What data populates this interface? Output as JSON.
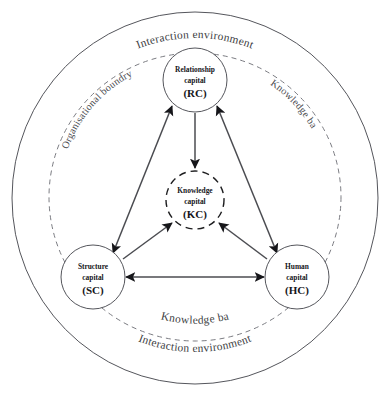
{
  "diagram": {
    "outer_label_top": "Interaction environment",
    "outer_label_bottom": "Interaction environment",
    "boundary_label_left": "Organisational boundry",
    "boundary_label_right": "Knowledge ba",
    "boundary_label_bottom": "Knowledge ba",
    "nodes": [
      {
        "id": "rc",
        "name": "relationship-capital",
        "line1": "Relationship",
        "line2": "capital",
        "abbr": "(RC)",
        "style": "solid"
      },
      {
        "id": "kc",
        "name": "knowledge-capital",
        "line1": "Knowledge",
        "line2": "capital",
        "abbr": "(KC)",
        "style": "dashed"
      },
      {
        "id": "sc",
        "name": "structure-capital",
        "line1": "Structure",
        "line2": "capital",
        "abbr": "(SC)",
        "style": "solid"
      },
      {
        "id": "hc",
        "name": "human-capital",
        "line1": "Human",
        "line2": "capital",
        "abbr": "(HC)",
        "style": "solid"
      }
    ],
    "edges": [
      {
        "from": "rc",
        "to": "sc",
        "arrows": "both"
      },
      {
        "from": "rc",
        "to": "hc",
        "arrows": "both"
      },
      {
        "from": "sc",
        "to": "hc",
        "arrows": "both"
      },
      {
        "from": "rc",
        "to": "kc",
        "arrows": "to"
      },
      {
        "from": "sc",
        "to": "kc",
        "arrows": "to"
      },
      {
        "from": "hc",
        "to": "kc",
        "arrows": "to"
      }
    ],
    "colors": {
      "background": "#ffffff",
      "outline": "#55565c",
      "dashed_outline": "#7b7c82",
      "link": "#4b4c51",
      "text": "#16161a",
      "curve_text": "#3c3d42"
    }
  }
}
